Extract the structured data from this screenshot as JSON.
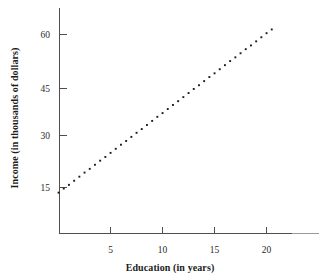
{
  "chart_data": {
    "type": "scatter",
    "title": "",
    "subtitle": "",
    "xlabel": "Education (in years)",
    "ylabel": "Income (in thousands of dollars)",
    "xlim": [
      0,
      25
    ],
    "ylim": [
      0,
      68
    ],
    "xticks": [
      5,
      10,
      15,
      20
    ],
    "yticks": [
      15,
      30,
      45,
      60
    ],
    "xtick_labels": [
      "5",
      "10",
      "15",
      "20"
    ],
    "ytick_labels": [
      "15",
      "30",
      "45",
      "60"
    ],
    "grid": false,
    "legend": false,
    "legend_position": "none",
    "marker": "square-dot",
    "marker_color": "#1b1b1b",
    "series": [
      {
        "name": "Income vs Education trend",
        "style": "dotted-line",
        "description": "Dotted straight line rising from left to right",
        "endpoints": {
          "start": {
            "x": 0.0,
            "y": 13.5
          },
          "end": {
            "x": 20.5,
            "y": 61.5
          }
        },
        "slope": 2.34,
        "intercept": 13.5,
        "x": [
          0.0,
          0.5,
          1.0,
          1.5,
          2.0,
          2.5,
          3.0,
          3.5,
          4.0,
          4.5,
          5.0,
          5.5,
          6.0,
          6.5,
          7.0,
          7.5,
          8.0,
          8.5,
          9.0,
          9.5,
          10.0,
          10.5,
          11.0,
          11.5,
          12.0,
          12.5,
          13.0,
          13.5,
          14.0,
          14.5,
          15.0,
          15.5,
          16.0,
          16.5,
          17.0,
          17.5,
          18.0,
          18.5,
          19.0,
          19.5,
          20.0,
          20.5
        ],
        "y": [
          13.5,
          14.7,
          15.8,
          17.0,
          18.2,
          19.4,
          20.5,
          21.7,
          22.9,
          24.0,
          25.2,
          26.4,
          27.6,
          28.7,
          29.9,
          31.1,
          32.2,
          33.4,
          34.6,
          35.8,
          36.9,
          38.1,
          39.3,
          40.4,
          41.6,
          42.8,
          44.0,
          45.1,
          46.3,
          47.5,
          48.6,
          49.8,
          51.0,
          52.2,
          53.3,
          54.5,
          55.7,
          56.8,
          58.0,
          59.2,
          60.4,
          61.5
        ]
      }
    ],
    "annotations": []
  },
  "axes": {
    "y_axis_name": "y-axis",
    "x_axis_name": "x-axis"
  }
}
